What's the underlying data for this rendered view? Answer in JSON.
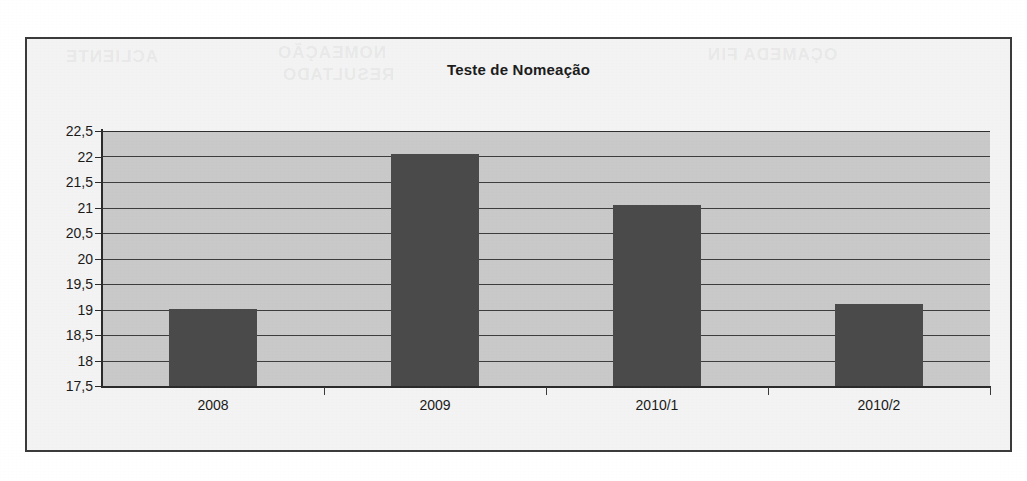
{
  "chart_data": {
    "type": "bar",
    "title": "Teste de Nomeação",
    "xlabel": "",
    "ylabel": "",
    "categories": [
      "2008",
      "2009",
      "2010/1",
      "2010/2"
    ],
    "values": [
      19,
      22.05,
      21.05,
      19.1
    ],
    "ylim": [
      17.5,
      22.5
    ],
    "yticks": [
      "22,5",
      "22",
      "21,5",
      "21",
      "20,5",
      "20",
      "19,5",
      "19",
      "18,5",
      "18",
      "17,5"
    ],
    "ytick_values": [
      22.5,
      22,
      21.5,
      21,
      20.5,
      20,
      19.5,
      19,
      18.5,
      18,
      17.5
    ],
    "grid": true,
    "legend": "none",
    "series": [
      {
        "name": "Teste de Nomeação",
        "values": [
          19,
          22.05,
          21.05,
          19.1
        ]
      }
    ],
    "colors": {
      "bar": "#4a4a4a",
      "plot_background": "#c9c9c9",
      "frame_background": "#f3f3f3",
      "gridline": "#3d3d3d",
      "axis": "#2b2b2b",
      "text": "#1a1a1a",
      "border": "#3a3a3a"
    }
  },
  "artifacts": {
    "bleed_1": "ACLIENTE",
    "bleed_2": "NOMEAÇÃO",
    "bleed_3": "RESULTADO",
    "bleed_4": "OÇAMEDA FIN"
  }
}
